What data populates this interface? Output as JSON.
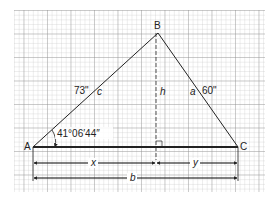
{
  "diagram": {
    "type": "triangle-on-grid",
    "vertices": {
      "A": "A",
      "B": "B",
      "C": "C"
    },
    "sides": {
      "c": "c",
      "a": "a",
      "b": "b"
    },
    "side_lengths": {
      "c": "73\"",
      "a": "60\""
    },
    "height_label": "h",
    "angle_A": "41°06′44″",
    "segments": {
      "x": "x",
      "y": "y",
      "b": "b"
    }
  }
}
